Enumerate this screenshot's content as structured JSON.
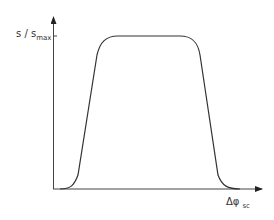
{
  "diagram": {
    "y_axis_label": "s / s",
    "y_axis_label_sub": "max",
    "x_axis_label": "Δφ",
    "x_axis_label_sub": "sc",
    "shape": "trapezoidal plateau curve",
    "line_color": "#333333"
  }
}
